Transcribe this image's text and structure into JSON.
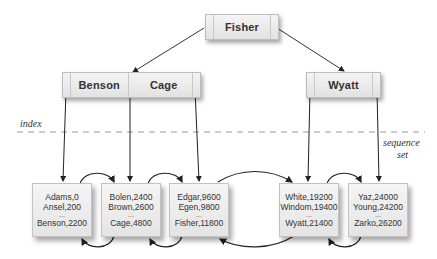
{
  "root": {
    "keys": [
      "Fisher"
    ]
  },
  "index_level": [
    {
      "keys": [
        "Benson",
        "Cage"
      ]
    },
    {
      "keys": [
        "Wyatt"
      ]
    }
  ],
  "labels": {
    "index": "index",
    "sequence_set_line1": "sequence",
    "sequence_set_line2": "set"
  },
  "sequence_set": [
    {
      "first": "Adams,0",
      "second": "Ansel,200",
      "ellipsis": "...",
      "last": "Benson,2200"
    },
    {
      "first": "Bolen,2400",
      "second": "Brown,2600",
      "ellipsis": "...",
      "last": "Cage,4800"
    },
    {
      "first": "Edgar,9600",
      "second": "Egen,9800",
      "ellipsis": "...",
      "last": "Fisher,11800"
    },
    {
      "first": "White,19200",
      "second": "Windom,19400",
      "ellipsis": "...",
      "last": "Wyatt,21400"
    },
    {
      "first": "Yaz,24000",
      "second": "Young,24200",
      "ellipsis": "...",
      "last": "Zarko,26200"
    }
  ]
}
